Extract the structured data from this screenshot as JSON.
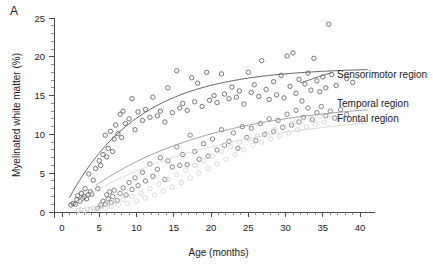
{
  "figure": {
    "panel_letter": "A",
    "width": 433,
    "height": 277
  },
  "chart_data": {
    "type": "scatter",
    "title": "",
    "xlabel": "Age (months)",
    "ylabel": "Myelinated white matter (%)",
    "xlim": [
      0,
      42
    ],
    "ylim": [
      0,
      25
    ],
    "xticks": [
      0,
      5,
      10,
      15,
      20,
      25,
      30,
      35,
      40
    ],
    "yticks": [
      0,
      5,
      10,
      15,
      20,
      25
    ],
    "xtick_labels": [
      "0",
      "5",
      "10",
      "15",
      "20",
      "25",
      "30",
      "35",
      "40"
    ],
    "ytick_labels": [
      "0",
      "5",
      "10",
      "15",
      "20",
      "25"
    ],
    "minor_ticks_per_interval": 4,
    "grid": false,
    "legend_position": "right-inline",
    "marker": "open-circle",
    "series": [
      {
        "name": "Sensorimotor region",
        "color": "#555555",
        "curve_color": "#555555",
        "label_anchor_x": 337,
        "label_anchor_y": 74,
        "fit": {
          "model": "saturating",
          "asymptote": 18.6,
          "rate": 0.105,
          "x_start": 1.0,
          "x_end": 41.0
        },
        "points": [
          [
            1.2,
            0.9
          ],
          [
            1.5,
            1.1
          ],
          [
            1.8,
            1.0
          ],
          [
            2.0,
            1.6
          ],
          [
            2.1,
            2.1
          ],
          [
            2.4,
            1.4
          ],
          [
            2.6,
            2.4
          ],
          [
            2.8,
            1.8
          ],
          [
            3.0,
            2.0
          ],
          [
            3.1,
            3.0
          ],
          [
            3.3,
            1.7
          ],
          [
            3.5,
            2.2
          ],
          [
            3.6,
            4.9
          ],
          [
            3.8,
            2.6
          ],
          [
            4.0,
            2.3
          ],
          [
            4.2,
            4.1
          ],
          [
            4.5,
            5.6
          ],
          [
            4.8,
            3.0
          ],
          [
            5.0,
            6.6
          ],
          [
            5.2,
            6.0
          ],
          [
            5.5,
            7.4
          ],
          [
            5.8,
            9.9
          ],
          [
            6.0,
            7.1
          ],
          [
            6.2,
            8.2
          ],
          [
            6.5,
            10.4
          ],
          [
            6.8,
            7.8
          ],
          [
            7.0,
            9.4
          ],
          [
            7.2,
            11.2
          ],
          [
            7.5,
            10.1
          ],
          [
            7.8,
            12.6
          ],
          [
            8.0,
            9.6
          ],
          [
            8.2,
            13.0
          ],
          [
            8.5,
            11.4
          ],
          [
            9.0,
            12.0
          ],
          [
            9.4,
            14.6
          ],
          [
            9.8,
            10.6
          ],
          [
            10.2,
            12.9
          ],
          [
            10.8,
            11.8
          ],
          [
            11.2,
            13.2
          ],
          [
            11.8,
            12.2
          ],
          [
            12.2,
            14.8
          ],
          [
            12.8,
            12.4
          ],
          [
            13.2,
            13.0
          ],
          [
            13.8,
            11.6
          ],
          [
            14.2,
            16.0
          ],
          [
            14.8,
            12.8
          ],
          [
            15.4,
            18.2
          ],
          [
            15.8,
            13.4
          ],
          [
            16.2,
            14.0
          ],
          [
            16.8,
            13.1
          ],
          [
            17.4,
            17.3
          ],
          [
            17.8,
            14.2
          ],
          [
            18.2,
            16.6
          ],
          [
            18.8,
            13.6
          ],
          [
            19.4,
            18.0
          ],
          [
            19.8,
            14.4
          ],
          [
            20.4,
            15.0
          ],
          [
            20.8,
            14.1
          ],
          [
            21.4,
            17.8
          ],
          [
            21.8,
            15.2
          ],
          [
            22.4,
            14.6
          ],
          [
            22.8,
            16.1
          ],
          [
            23.4,
            14.8
          ],
          [
            23.8,
            15.6
          ],
          [
            24.4,
            13.9
          ],
          [
            25.0,
            18.0
          ],
          [
            25.4,
            15.4
          ],
          [
            25.8,
            16.4
          ],
          [
            26.4,
            14.9
          ],
          [
            26.8,
            19.5
          ],
          [
            27.4,
            15.8
          ],
          [
            27.8,
            14.5
          ],
          [
            28.4,
            16.8
          ],
          [
            28.8,
            15.1
          ],
          [
            29.4,
            17.6
          ],
          [
            29.8,
            14.7
          ],
          [
            30.2,
            20.1
          ],
          [
            30.6,
            16.2
          ],
          [
            31.0,
            20.5
          ],
          [
            31.4,
            15.3
          ],
          [
            31.8,
            17.1
          ],
          [
            32.2,
            14.3
          ],
          [
            32.6,
            16.5
          ],
          [
            33.0,
            17.9
          ],
          [
            33.4,
            15.7
          ],
          [
            33.8,
            19.8
          ],
          [
            34.2,
            16.9
          ],
          [
            34.6,
            15.5
          ],
          [
            35.0,
            17.4
          ],
          [
            35.4,
            16.0
          ],
          [
            35.8,
            24.2
          ],
          [
            36.2,
            17.7
          ],
          [
            36.8,
            16.3
          ],
          [
            38.2,
            17.2
          ],
          [
            39.0,
            16.7
          ]
        ]
      },
      {
        "name": "Temporal region",
        "color": "#6b6b6b",
        "curve_color": "#999999",
        "label_anchor_x": 337,
        "label_anchor_y": 103,
        "fit": {
          "model": "saturating",
          "asymptote": 14.4,
          "rate": 0.06,
          "x_start": 4.5,
          "x_end": 41.0
        },
        "points": [
          [
            4.8,
            0.5
          ],
          [
            5.2,
            0.9
          ],
          [
            5.5,
            1.4
          ],
          [
            5.8,
            1.0
          ],
          [
            6.0,
            2.2
          ],
          [
            6.2,
            1.7
          ],
          [
            6.4,
            2.6
          ],
          [
            6.6,
            1.2
          ],
          [
            6.8,
            2.0
          ],
          [
            7.0,
            2.8
          ],
          [
            7.4,
            1.5
          ],
          [
            7.8,
            2.4
          ],
          [
            8.2,
            3.1
          ],
          [
            8.6,
            2.2
          ],
          [
            9.0,
            3.8
          ],
          [
            9.4,
            2.9
          ],
          [
            9.8,
            4.4
          ],
          [
            10.2,
            3.4
          ],
          [
            10.8,
            5.1
          ],
          [
            11.2,
            4.0
          ],
          [
            11.8,
            6.2
          ],
          [
            12.2,
            4.6
          ],
          [
            12.8,
            5.5
          ],
          [
            13.2,
            7.0
          ],
          [
            13.8,
            4.2
          ],
          [
            14.2,
            6.6
          ],
          [
            14.8,
            5.8
          ],
          [
            15.4,
            8.4
          ],
          [
            15.8,
            6.0
          ],
          [
            16.2,
            7.4
          ],
          [
            16.8,
            6.1
          ],
          [
            17.2,
            9.9
          ],
          [
            17.8,
            7.8
          ],
          [
            18.4,
            6.8
          ],
          [
            19.0,
            8.8
          ],
          [
            19.6,
            7.2
          ],
          [
            20.2,
            9.4
          ],
          [
            20.8,
            8.0
          ],
          [
            21.4,
            10.6
          ],
          [
            21.8,
            8.6
          ],
          [
            22.4,
            9.1
          ],
          [
            23.0,
            10.2
          ],
          [
            23.6,
            8.2
          ],
          [
            24.2,
            11.0
          ],
          [
            24.8,
            9.6
          ],
          [
            25.4,
            10.8
          ],
          [
            26.0,
            9.2
          ],
          [
            26.6,
            11.4
          ],
          [
            27.2,
            10.0
          ],
          [
            27.8,
            12.0
          ],
          [
            28.4,
            10.4
          ],
          [
            29.0,
            11.8
          ],
          [
            29.6,
            10.9
          ],
          [
            30.2,
            12.6
          ],
          [
            30.8,
            11.2
          ],
          [
            31.4,
            13.1
          ],
          [
            31.8,
            11.6
          ],
          [
            32.4,
            12.2
          ],
          [
            33.0,
            13.4
          ],
          [
            33.6,
            11.9
          ],
          [
            34.2,
            12.8
          ],
          [
            34.8,
            13.6
          ],
          [
            35.4,
            12.4
          ],
          [
            36.0,
            13.0
          ],
          [
            36.6,
            12.1
          ],
          [
            37.4,
            13.2
          ],
          [
            38.2,
            12.6
          ]
        ]
      },
      {
        "name": "Frontal region",
        "color": "#d0d0d0",
        "curve_color": "#d8d8d8",
        "label_anchor_x": 337,
        "label_anchor_y": 118,
        "fit": {
          "model": "saturating",
          "asymptote": 13.0,
          "rate": 0.052,
          "x_start": 2.0,
          "x_end": 41.0
        },
        "points": [
          [
            2.2,
            0.2
          ],
          [
            2.6,
            0.3
          ],
          [
            3.0,
            0.2
          ],
          [
            3.4,
            0.4
          ],
          [
            3.8,
            0.3
          ],
          [
            4.2,
            0.5
          ],
          [
            4.6,
            0.4
          ],
          [
            5.0,
            0.6
          ],
          [
            5.4,
            0.8
          ],
          [
            5.8,
            0.5
          ],
          [
            6.2,
            1.0
          ],
          [
            6.6,
            0.7
          ],
          [
            7.0,
            1.3
          ],
          [
            7.6,
            0.9
          ],
          [
            8.2,
            1.6
          ],
          [
            8.8,
            1.1
          ],
          [
            9.4,
            2.0
          ],
          [
            10.0,
            1.4
          ],
          [
            10.6,
            2.4
          ],
          [
            11.2,
            1.8
          ],
          [
            11.8,
            3.0
          ],
          [
            12.4,
            2.2
          ],
          [
            13.0,
            3.6
          ],
          [
            13.6,
            2.7
          ],
          [
            14.2,
            4.2
          ],
          [
            14.8,
            3.2
          ],
          [
            15.4,
            4.8
          ],
          [
            16.0,
            3.8
          ],
          [
            16.6,
            5.4
          ],
          [
            17.2,
            4.4
          ],
          [
            17.8,
            6.0
          ],
          [
            18.4,
            5.0
          ],
          [
            19.0,
            6.6
          ],
          [
            19.6,
            5.6
          ],
          [
            20.2,
            7.2
          ],
          [
            20.8,
            6.2
          ],
          [
            21.4,
            7.8
          ],
          [
            22.0,
            6.8
          ],
          [
            22.6,
            8.4
          ],
          [
            23.2,
            7.4
          ],
          [
            23.8,
            9.0
          ],
          [
            24.4,
            8.0
          ],
          [
            25.0,
            9.4
          ],
          [
            25.6,
            8.6
          ],
          [
            26.2,
            9.8
          ],
          [
            26.8,
            9.0
          ],
          [
            27.4,
            10.2
          ],
          [
            28.0,
            9.4
          ],
          [
            28.6,
            10.6
          ],
          [
            29.2,
            9.8
          ],
          [
            29.8,
            11.0
          ],
          [
            30.4,
            10.2
          ],
          [
            31.0,
            11.4
          ],
          [
            31.6,
            10.6
          ],
          [
            32.2,
            11.8
          ],
          [
            32.8,
            11.0
          ],
          [
            33.4,
            12.0
          ],
          [
            34.0,
            11.3
          ],
          [
            34.6,
            12.3
          ],
          [
            35.2,
            11.6
          ],
          [
            36.0,
            12.5
          ],
          [
            37.0,
            12.0
          ]
        ]
      }
    ]
  }
}
